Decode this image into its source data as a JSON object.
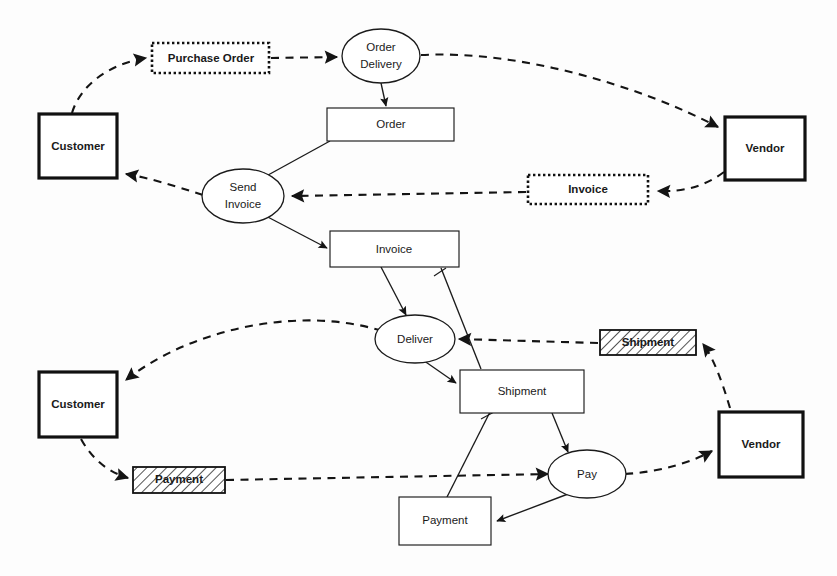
{
  "diagram": {
    "type": "process-collaboration-diagram",
    "colors": {
      "background": "#fdfdfd",
      "stroke": "#1b1b1b",
      "party_stroke": "#111111",
      "hatch_fill": "#ffffff",
      "text": "#1a1a1a"
    },
    "legend_shapes": {
      "party": "heavy-bordered rectangle",
      "activity": "ellipse",
      "document": "thin rectangle",
      "message": "dotted rectangle",
      "physical": "hatched rectangle"
    },
    "nodes": {
      "customer_top": {
        "label": "Customer",
        "kind": "party",
        "bold": true
      },
      "customer_bottom": {
        "label": "Customer",
        "kind": "party",
        "bold": true
      },
      "vendor_top": {
        "label": "Vendor",
        "kind": "party",
        "bold": true
      },
      "vendor_bottom": {
        "label": "Vendor",
        "kind": "party",
        "bold": true
      },
      "purchase_order_msg": {
        "label": "Purchase Order",
        "kind": "message",
        "bold": true
      },
      "invoice_msg": {
        "label": "Invoice",
        "kind": "message",
        "bold": true
      },
      "shipment_phys": {
        "label": "Shipment",
        "kind": "physical",
        "bold": true
      },
      "payment_phys": {
        "label": "Payment",
        "kind": "physical",
        "bold": true
      },
      "order_delivery_act": {
        "label_line1": "Order",
        "label_line2": "Delivery",
        "kind": "activity",
        "bold": false
      },
      "send_invoice_act": {
        "label_line1": "Send",
        "label_line2": "Invoice",
        "kind": "activity",
        "bold": false
      },
      "deliver_act": {
        "label": "Deliver",
        "kind": "activity",
        "bold": false
      },
      "pay_act": {
        "label": "Pay",
        "kind": "activity",
        "bold": false
      },
      "order_doc": {
        "label": "Order",
        "kind": "document",
        "bold": false
      },
      "invoice_doc": {
        "label": "Invoice",
        "kind": "document",
        "bold": false
      },
      "shipment_doc": {
        "label": "Shipment",
        "kind": "document",
        "bold": false
      },
      "payment_doc": {
        "label": "Payment",
        "kind": "document",
        "bold": false
      }
    },
    "edges": [
      {
        "from": "customer_top",
        "to": "purchase_order_msg",
        "style": "dashed"
      },
      {
        "from": "purchase_order_msg",
        "to": "order_delivery_act",
        "style": "dashed"
      },
      {
        "from": "order_delivery_act",
        "to": "vendor_top",
        "style": "dashed"
      },
      {
        "from": "order_delivery_act",
        "to": "order_doc",
        "style": "solid"
      },
      {
        "from": "order_doc",
        "to": "send_invoice_act",
        "style": "solid"
      },
      {
        "from": "vendor_top",
        "to": "invoice_msg",
        "style": "dashed"
      },
      {
        "from": "invoice_msg",
        "to": "send_invoice_act",
        "style": "dashed"
      },
      {
        "from": "send_invoice_act",
        "to": "customer_top",
        "style": "dashed"
      },
      {
        "from": "send_invoice_act",
        "to": "invoice_doc",
        "style": "solid"
      },
      {
        "from": "invoice_doc",
        "to": "deliver_act",
        "style": "solid"
      },
      {
        "from": "shipment_doc",
        "to": "invoice_doc",
        "style": "solid"
      },
      {
        "from": "vendor_bottom",
        "to": "shipment_phys",
        "style": "dashed"
      },
      {
        "from": "shipment_phys",
        "to": "deliver_act",
        "style": "dashed"
      },
      {
        "from": "deliver_act",
        "to": "customer_bottom",
        "style": "dashed"
      },
      {
        "from": "deliver_act",
        "to": "shipment_doc",
        "style": "solid"
      },
      {
        "from": "shipment_doc",
        "to": "pay_act",
        "style": "solid"
      },
      {
        "from": "customer_bottom",
        "to": "payment_phys",
        "style": "dashed"
      },
      {
        "from": "payment_phys",
        "to": "pay_act",
        "style": "dashed"
      },
      {
        "from": "pay_act",
        "to": "vendor_bottom",
        "style": "dashed"
      },
      {
        "from": "pay_act",
        "to": "payment_doc",
        "style": "solid"
      },
      {
        "from": "payment_doc",
        "to": "shipment_doc",
        "style": "solid"
      }
    ]
  }
}
